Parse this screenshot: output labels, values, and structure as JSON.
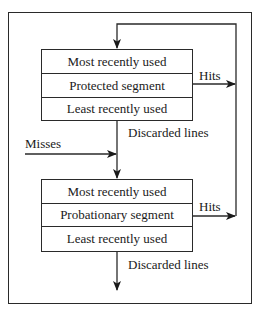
{
  "diagram": {
    "protected_segment": {
      "rows": [
        "Most recently used",
        "Protected segment",
        "Least recently used"
      ]
    },
    "probationary_segment": {
      "rows": [
        "Most recently used",
        "Probationary segment",
        "Least recently used"
      ]
    },
    "labels": {
      "hits_top": "Hits",
      "hits_bottom": "Hits",
      "misses": "Misses",
      "discarded_top": "Discarded lines",
      "discarded_bottom": "Discarded lines"
    }
  }
}
